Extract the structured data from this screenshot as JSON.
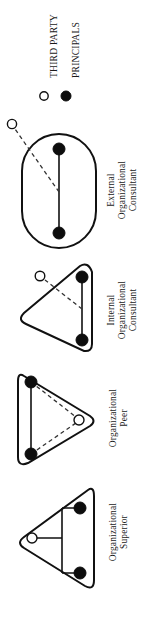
{
  "figure": {
    "orientation": "rotated-90-ccw",
    "background_color": "#ffffff",
    "ink_color": "#111111"
  },
  "legend": {
    "name": "legend",
    "items": [
      {
        "label": "THIRD PARTY",
        "marker": "hollow-circle-icon",
        "marker_fill": "#ffffff",
        "marker_stroke": "#111111"
      },
      {
        "label": "PRINCIPALS",
        "marker": "filled-circle-icon",
        "marker_fill": "#0d0d0d",
        "marker_stroke": "#0d0d0d"
      }
    ]
  },
  "diagrams": [
    {
      "id": "external-organizational-consultant",
      "caption_lines": [
        "External",
        "Organizational",
        "Consultant"
      ],
      "boundary_shape": "stadium",
      "third_party_position": "outside-boundary",
      "principals_count": 2,
      "principal_link": "solid",
      "third_party_link": "dashed"
    },
    {
      "id": "internal-organizational-consultant",
      "caption_lines": [
        "Internal",
        "Organizational",
        "Consultant"
      ],
      "boundary_shape": "rounded-triangle-left",
      "third_party_position": "inside-boundary",
      "principals_count": 2,
      "principal_link": "solid",
      "third_party_link": "dashed"
    },
    {
      "id": "organizational-peer",
      "caption_lines": [
        "Organizational",
        "Peer"
      ],
      "boundary_shape": "rounded-triangle-right",
      "third_party_position": "inside-boundary-vertex",
      "principals_count": 2,
      "principal_link": "solid",
      "third_party_link": "dashed"
    },
    {
      "id": "organizational-superior",
      "caption_lines": [
        "Organizational",
        "Superior"
      ],
      "boundary_shape": "rounded-triangle-left",
      "third_party_position": "inside-boundary-vertex",
      "principals_count": 2,
      "principal_link": "solid-bracket",
      "third_party_link": "solid"
    }
  ]
}
